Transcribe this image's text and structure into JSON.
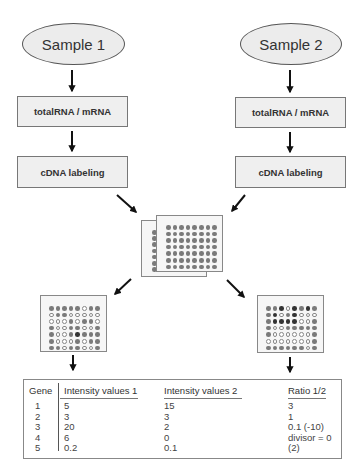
{
  "samples": [
    {
      "label": "Sample 1",
      "step1": "totalRNA / mRNA",
      "step2": "cDNA labeling"
    },
    {
      "label": "Sample 2",
      "step1": "totalRNA / mRNA",
      "step2": "cDNA labeling"
    }
  ],
  "microarray": {
    "front_chip": {
      "cols": 8,
      "rows": 7
    },
    "back_chip_visible_column": 7
  },
  "result_arrays": [
    {
      "name": "Result array 1",
      "pattern": [
        "gggggogg",
        "oggooooo",
        "ooogoggo",
        "googgoog",
        "googdggg",
        "gooogogg",
        "ggoggoog"
      ]
    },
    {
      "name": "Result array 2",
      "pattern": [
        "ggdodgdg",
        "gdogdooo",
        "gddddoog",
        "googgggg",
        "goooooog",
        "ooooooog",
        "ggggggog"
      ]
    }
  ],
  "table": {
    "headers": {
      "gene": "Gene",
      "int1": "Intensity values 1",
      "int2": "Intensity values 2",
      "ratio": "Ratio 1/2"
    },
    "rows": [
      {
        "gene": "1",
        "int1": "5",
        "int2": "15",
        "ratio": "3"
      },
      {
        "gene": "2",
        "int1": "3",
        "int2": "3",
        "ratio": "1"
      },
      {
        "gene": "3",
        "int1": "20",
        "int2": "2",
        "ratio": "0.1   (-10)"
      },
      {
        "gene": "4",
        "int1": "6",
        "int2": "0",
        "ratio": "divisor = 0"
      },
      {
        "gene": "5",
        "int1": "0.2",
        "int2": "0.1",
        "ratio": "(2)"
      }
    ]
  },
  "colors": {
    "shape_fill": "#ececec",
    "box_fill": "#efefef",
    "arrow": "#111111",
    "dot_grey": "#7a7a7a",
    "dot_dark": "#333333"
  }
}
